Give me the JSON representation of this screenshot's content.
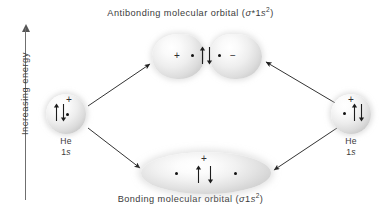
{
  "figure": {
    "type": "molecular-orbital-energy-diagram",
    "background_color": "#ffffff",
    "ink_color": "#2b2b2b"
  },
  "energy_axis": {
    "label": "Increasing energy",
    "direction": "up",
    "arrow_icon": "up-arrow-icon"
  },
  "captions": {
    "top": {
      "text_before": "Antibonding molecular orbital (",
      "sigma": "σ",
      "star": "*1",
      "orbital_letter": "s",
      "superscript": "2",
      "text_after": ")",
      "full": "Antibonding molecular orbital (σ*1s2)"
    },
    "bottom": {
      "text_before": "Bonding molecular orbital (",
      "sigma": "σ",
      "star": "1",
      "orbital_letter": "s",
      "superscript": "2",
      "text_after": ")",
      "full": "Bonding molecular orbital (σ1s2)"
    }
  },
  "atomic_orbitals": [
    {
      "id": "left",
      "element": "He",
      "shell": "1",
      "orbital_letter": "s",
      "phase_sign": "+",
      "electrons": 2,
      "spin_pair": "up-down",
      "nucleus_dots": 1
    },
    {
      "id": "right",
      "element": "He",
      "shell": "1",
      "orbital_letter": "s",
      "phase_sign": "+",
      "electrons": 2,
      "spin_pair": "up-down",
      "nucleus_dots": 1
    }
  ],
  "molecular_orbitals": {
    "antibonding": {
      "name": "Antibonding molecular orbital",
      "left_sign": "+",
      "right_sign": "−",
      "nucleus_dots": 2,
      "electrons": 2,
      "spin_pair": "up-down"
    },
    "bonding": {
      "name": "Bonding molecular orbital",
      "sign": "+",
      "nucleus_dots": 2,
      "electrons": 2,
      "spin_pair": "up-down"
    }
  },
  "transition_arrows": [
    {
      "id": "left-to-antibonding",
      "from": "left-atomic-orbital",
      "to": "antibonding-orbital",
      "direction": "up-right"
    },
    {
      "id": "left-to-bonding",
      "from": "left-atomic-orbital",
      "to": "bonding-orbital",
      "direction": "down-right"
    },
    {
      "id": "right-to-antibonding",
      "from": "right-atomic-orbital",
      "to": "antibonding-orbital",
      "direction": "up-left"
    },
    {
      "id": "right-to-bonding",
      "from": "right-atomic-orbital",
      "to": "bonding-orbital",
      "direction": "down-left"
    }
  ]
}
